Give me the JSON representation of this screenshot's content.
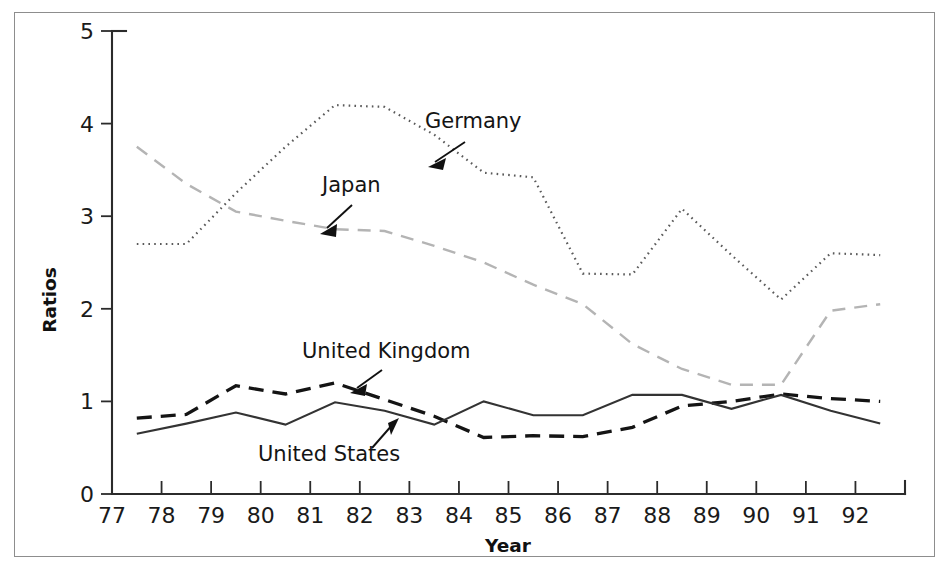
{
  "figure": {
    "kind": "line-chart-figure",
    "background_color": "#ffffff",
    "frame_color": "#8d8d8d"
  },
  "axes": {
    "y_title": "Ratios",
    "x_title": "Year",
    "y_ticks": [
      "0",
      "1",
      "2",
      "3",
      "4",
      "5"
    ],
    "x_ticks": [
      "77",
      "78",
      "79",
      "80",
      "81",
      "82",
      "83",
      "84",
      "85",
      "86",
      "87",
      "88",
      "89",
      "90",
      "91",
      "92"
    ]
  },
  "annotations": [
    {
      "name": "germany",
      "label": "Germany"
    },
    {
      "name": "japan",
      "label": "Japan"
    },
    {
      "name": "united-kingdom",
      "label": "United Kingdom"
    },
    {
      "name": "united-states",
      "label": "United States"
    }
  ],
  "chart_data": {
    "type": "line",
    "title": "",
    "xlabel": "Year",
    "ylabel": "Ratios",
    "xlim": [
      77,
      93
    ],
    "ylim": [
      0,
      5
    ],
    "x_tick_values": [
      77,
      78,
      79,
      80,
      81,
      82,
      83,
      84,
      85,
      86,
      87,
      88,
      89,
      90,
      91,
      92
    ],
    "x_tick_labels": [
      "77",
      "78",
      "79",
      "80",
      "81",
      "82",
      "83",
      "84",
      "85",
      "86",
      "87",
      "88",
      "89",
      "90",
      "91",
      "92"
    ],
    "y_tick_values": [
      0,
      1,
      2,
      3,
      4,
      5
    ],
    "y_tick_labels": [
      "0",
      "1",
      "2",
      "3",
      "4",
      "5"
    ],
    "grid": false,
    "legend": "inline-annotations",
    "x": [
      77.5,
      78.5,
      79.5,
      80.5,
      81.5,
      82.5,
      83.5,
      84.5,
      85.5,
      86.5,
      87.5,
      88.5,
      89.5,
      90.5,
      91.5,
      92.5
    ],
    "series": [
      {
        "name": "Germany",
        "style": "dotted",
        "color": "#5a5a5a",
        "values": [
          2.7,
          2.7,
          3.25,
          3.75,
          4.2,
          4.18,
          3.88,
          3.47,
          3.42,
          2.38,
          2.37,
          3.08,
          2.58,
          2.1,
          2.6,
          2.58
        ]
      },
      {
        "name": "Japan",
        "style": "dashed",
        "color": "#b4b4b4",
        "values": [
          3.75,
          3.35,
          3.05,
          2.95,
          2.86,
          2.84,
          2.68,
          2.5,
          2.26,
          2.05,
          1.62,
          1.35,
          1.18,
          1.18,
          1.98,
          2.05
        ]
      },
      {
        "name": "United Kingdom",
        "style": "dashed-bold",
        "color": "#141414",
        "values": [
          0.82,
          0.86,
          1.17,
          1.08,
          1.2,
          1.02,
          0.84,
          0.61,
          0.63,
          0.62,
          0.72,
          0.95,
          1.0,
          1.08,
          1.03,
          1.0
        ]
      },
      {
        "name": "United States",
        "style": "solid",
        "color": "#333333",
        "values": [
          0.65,
          0.76,
          0.88,
          0.75,
          0.99,
          0.9,
          0.75,
          1.0,
          0.85,
          0.85,
          1.07,
          1.07,
          0.92,
          1.07,
          0.9,
          0.76
        ]
      }
    ]
  }
}
